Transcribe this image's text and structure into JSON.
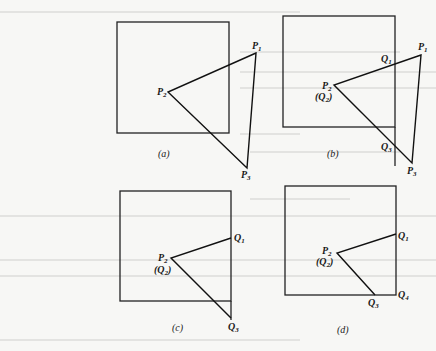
{
  "figure": {
    "panels": [
      {
        "caption": "(a)",
        "window": {
          "x1": 117,
          "y1": 22,
          "x2": 229,
          "y2": 133
        },
        "polygon": [
          [
            256,
            53
          ],
          [
            168,
            92
          ],
          [
            247,
            168
          ]
        ],
        "labels": [
          {
            "text": "P",
            "sub": "1",
            "x": 252,
            "y": 49
          },
          {
            "text": "P",
            "sub": "2",
            "x": 157,
            "y": 95
          },
          {
            "text": "P",
            "sub": "3",
            "x": 241,
            "y": 178
          }
        ],
        "caption_pos": {
          "x": 158,
          "y": 157
        }
      },
      {
        "caption": "(b)",
        "window": {
          "x1": 283,
          "y1": 16,
          "x2": 395,
          "y2": 127
        },
        "clip_edge_extend_y": 166,
        "polygon": [
          [
            421,
            55
          ],
          [
            334,
            85
          ],
          [
            412,
            163
          ]
        ],
        "labels": [
          {
            "text": "P",
            "sub": "1",
            "x": 418,
            "y": 50
          },
          {
            "text": "Q",
            "sub": "1",
            "x": 381,
            "y": 62
          },
          {
            "text": "P",
            "sub": "2",
            "x": 322,
            "y": 89
          },
          {
            "text": "(Q",
            "sub": "2",
            "tail": ")",
            "x": 315,
            "y": 100
          },
          {
            "text": "Q",
            "sub": "3",
            "x": 381,
            "y": 150
          },
          {
            "text": "P",
            "sub": "3",
            "x": 407,
            "y": 174
          }
        ],
        "caption_pos": {
          "x": 327,
          "y": 157
        }
      },
      {
        "caption": "(c)",
        "window": {
          "x1": 120,
          "y1": 191,
          "x2": 231,
          "y2": 301
        },
        "clip_edge_extend_y": 320,
        "polyline": [
          [
            231,
            238
          ],
          [
            171,
            258
          ],
          [
            231,
            318
          ]
        ],
        "labels": [
          {
            "text": "Q",
            "sub": "1",
            "x": 234,
            "y": 241
          },
          {
            "text": "P",
            "sub": "2",
            "x": 158,
            "y": 261
          },
          {
            "text": "(Q",
            "sub": "2",
            "tail": ")",
            "x": 154,
            "y": 273
          },
          {
            "text": "Q",
            "sub": "3",
            "x": 228,
            "y": 330
          }
        ],
        "caption_pos": {
          "x": 172,
          "y": 331
        }
      },
      {
        "caption": "(d)",
        "window": {
          "x1": 285,
          "y1": 186,
          "x2": 396,
          "y2": 295
        },
        "polyline": [
          [
            396,
            234
          ],
          [
            337,
            253
          ],
          [
            375,
            295
          ]
        ],
        "labels": [
          {
            "text": "Q",
            "sub": "1",
            "x": 398,
            "y": 239
          },
          {
            "text": "P",
            "sub": "2",
            "x": 322,
            "y": 254
          },
          {
            "text": "(Q",
            "sub": "2",
            "tail": ")",
            "x": 316,
            "y": 265
          },
          {
            "text": "Q",
            "sub": "3",
            "x": 368,
            "y": 306
          },
          {
            "text": "Q",
            "sub": "4",
            "x": 398,
            "y": 298
          }
        ],
        "caption_pos": {
          "x": 337,
          "y": 333
        }
      }
    ]
  }
}
